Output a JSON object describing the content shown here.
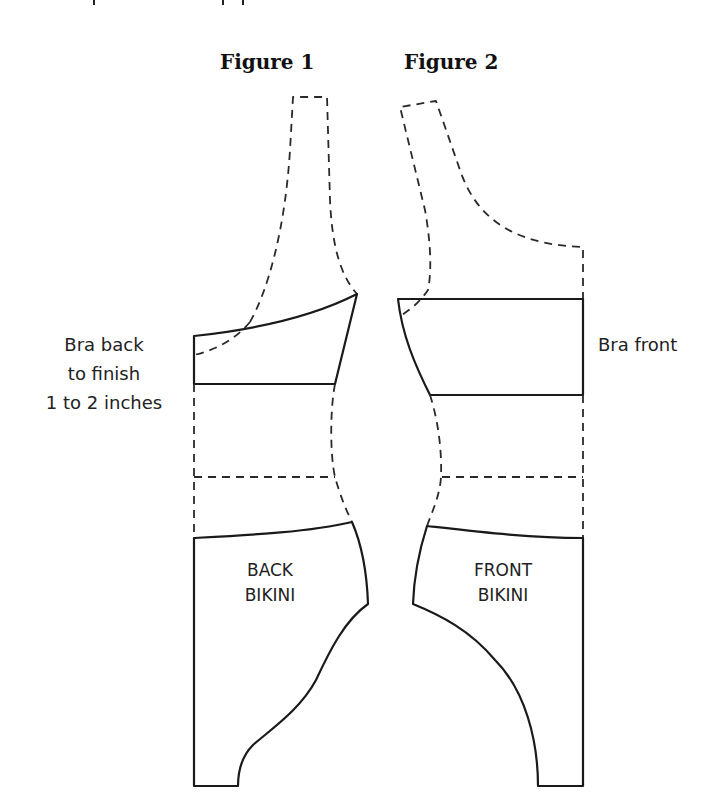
{
  "figures": [
    {
      "title": "Figure 1",
      "side_label_lines": [
        "Bra back",
        "to finish",
        "1 to 2 inches"
      ],
      "piece_label_lines": [
        "BACK",
        "BIKINI"
      ]
    },
    {
      "title": "Figure 2",
      "side_label_lines": [
        "Bra front"
      ],
      "piece_label_lines": [
        "FRONT",
        "BIKINI"
      ]
    }
  ],
  "colors": {
    "line": "#1a1a1a",
    "dashed": "#2a2a2a",
    "background": "#ffffff"
  }
}
